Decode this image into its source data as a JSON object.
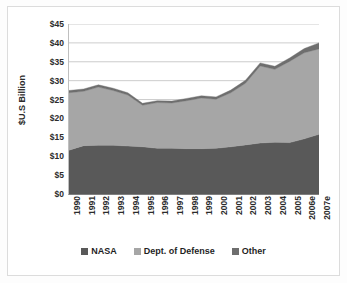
{
  "chart_data": {
    "type": "area",
    "stacked": true,
    "title": "",
    "xlabel": "",
    "ylabel": "$U.S Billion",
    "ylim": [
      0,
      45
    ],
    "ytick_step": 5,
    "ytick_labels": [
      "$45",
      "$40",
      "$35",
      "$30",
      "$25",
      "$20",
      "$15",
      "$10",
      "$5",
      "$0"
    ],
    "ytick_values": [
      45,
      40,
      35,
      30,
      25,
      20,
      15,
      10,
      5,
      0
    ],
    "grid": "horizontal",
    "legend_position": "bottom",
    "categories": [
      "1990",
      "1991",
      "1992",
      "1993",
      "1994",
      "1995",
      "1996",
      "1997",
      "1998",
      "1999",
      "2000",
      "2001",
      "2002",
      "2003",
      "2004",
      "2005",
      "2006e",
      "2007e"
    ],
    "series": [
      {
        "name": "NASA",
        "color": "#595959",
        "values": [
          11.6,
          12.8,
          12.9,
          12.9,
          12.7,
          12.5,
          12.1,
          12.1,
          12.0,
          12.0,
          12.1,
          12.5,
          13.0,
          13.5,
          13.7,
          13.6,
          14.6,
          15.8
        ]
      },
      {
        "name": "Dept. of Defense",
        "color": "#a6a6a6",
        "values": [
          15.2,
          14.4,
          15.4,
          14.5,
          13.5,
          11.0,
          12.1,
          12.0,
          12.7,
          13.4,
          13.0,
          14.3,
          16.3,
          20.4,
          19.3,
          21.5,
          22.8,
          22.6
        ]
      },
      {
        "name": "Other",
        "color": "#6e6e6e",
        "values": [
          0.6,
          0.6,
          0.6,
          0.6,
          0.6,
          0.5,
          0.5,
          0.5,
          0.6,
          0.6,
          0.6,
          0.7,
          0.8,
          0.8,
          0.8,
          0.9,
          1.1,
          1.6
        ]
      }
    ],
    "totals": [
      27.4,
      27.8,
      28.9,
      28.0,
      26.8,
      24.0,
      24.7,
      24.6,
      25.3,
      26.0,
      25.7,
      27.5,
      30.1,
      34.7,
      33.8,
      36.0,
      38.5,
      40.0
    ]
  },
  "colors": {
    "nasa": "#595959",
    "dod": "#a6a6a6",
    "other": "#6e6e6e",
    "grid": "#bfbfbf",
    "axis": "#7f7f7f",
    "frame": "#dcdcdc",
    "text": "#2b2b2b",
    "background": "#ffffff"
  },
  "legend": {
    "items": [
      {
        "label": "NASA",
        "color": "#595959"
      },
      {
        "label": "Dept. of Defense",
        "color": "#a6a6a6"
      },
      {
        "label": "Other",
        "color": "#6e6e6e"
      }
    ]
  }
}
